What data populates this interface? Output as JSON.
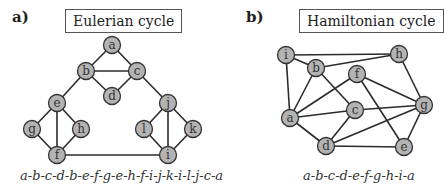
{
  "panels": [
    {
      "label": "a)",
      "title": "Eulerian cycle",
      "caption": "a-b-c-d-b-e-f-g-e-h-f-i-j-k-i-l-j-c-a",
      "nodes": [
        {
          "id": "a",
          "x": 112,
          "y": 45
        },
        {
          "id": "b",
          "x": 86,
          "y": 71
        },
        {
          "id": "c",
          "x": 137,
          "y": 71
        },
        {
          "id": "d",
          "x": 112,
          "y": 96
        },
        {
          "id": "e",
          "x": 57,
          "y": 103
        },
        {
          "id": "g",
          "x": 32,
          "y": 129
        },
        {
          "id": "h",
          "x": 81,
          "y": 129
        },
        {
          "id": "f",
          "x": 57,
          "y": 155
        },
        {
          "id": "j",
          "x": 168,
          "y": 103
        },
        {
          "id": "l",
          "x": 144,
          "y": 129
        },
        {
          "id": "k",
          "x": 193,
          "y": 129
        },
        {
          "id": "i",
          "x": 168,
          "y": 155
        }
      ],
      "edges": [
        [
          "a",
          "b"
        ],
        [
          "a",
          "c"
        ],
        [
          "b",
          "c"
        ],
        [
          "b",
          "d"
        ],
        [
          "c",
          "d"
        ],
        [
          "b",
          "e"
        ],
        [
          "c",
          "j"
        ],
        [
          "e",
          "g"
        ],
        [
          "e",
          "h"
        ],
        [
          "e",
          "f"
        ],
        [
          "g",
          "f"
        ],
        [
          "h",
          "f"
        ],
        [
          "f",
          "i"
        ],
        [
          "j",
          "l"
        ],
        [
          "j",
          "k"
        ],
        [
          "j",
          "i"
        ],
        [
          "l",
          "i"
        ],
        [
          "k",
          "i"
        ]
      ]
    },
    {
      "label": "b)",
      "title": "Hamiltonian cycle",
      "caption": "a-b-c-d-e-f-g-h-i-a",
      "nodes": [
        {
          "id": "i",
          "x": 286,
          "y": 55
        },
        {
          "id": "h",
          "x": 399,
          "y": 54
        },
        {
          "id": "b",
          "x": 316,
          "y": 68
        },
        {
          "id": "f",
          "x": 357,
          "y": 74
        },
        {
          "id": "a",
          "x": 290,
          "y": 118
        },
        {
          "id": "c",
          "x": 355,
          "y": 110
        },
        {
          "id": "g",
          "x": 424,
          "y": 105
        },
        {
          "id": "d",
          "x": 326,
          "y": 146
        },
        {
          "id": "e",
          "x": 404,
          "y": 147
        }
      ],
      "edges": [
        [
          "i",
          "h"
        ],
        [
          "i",
          "b"
        ],
        [
          "i",
          "a"
        ],
        [
          "b",
          "h"
        ],
        [
          "b",
          "a"
        ],
        [
          "b",
          "c"
        ],
        [
          "f",
          "a"
        ],
        [
          "f",
          "g"
        ],
        [
          "f",
          "e"
        ],
        [
          "a",
          "c"
        ],
        [
          "a",
          "d"
        ],
        [
          "c",
          "g"
        ],
        [
          "c",
          "d"
        ],
        [
          "d",
          "g"
        ],
        [
          "d",
          "e"
        ],
        [
          "e",
          "g"
        ],
        [
          "h",
          "g"
        ]
      ]
    }
  ]
}
